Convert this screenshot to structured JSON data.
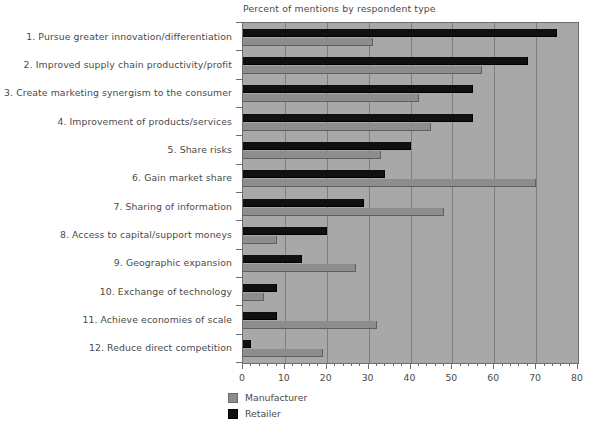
{
  "chart_data": {
    "type": "bar",
    "orientation": "horizontal",
    "title": "Percent of mentions by respondent type",
    "xlabel": "",
    "ylabel": "",
    "xlim": [
      0,
      80
    ],
    "xticks": [
      0,
      10,
      20,
      30,
      40,
      50,
      60,
      70,
      80
    ],
    "xtick_labels": [
      "0",
      "10",
      "20",
      "30",
      "40",
      "50",
      "60",
      "70",
      "80"
    ],
    "minor_tick_interval": 2,
    "grid": true,
    "grid_axis": "x",
    "legend_position": "bottom-left",
    "plot_background": "#a8a8a8",
    "categories": [
      "1. Pursue greater innovation/differentiation",
      "2. Improved supply chain productivity/profit",
      "3. Create marketing synergism to the consumer",
      "4. Improvement of products/services",
      "5. Share risks",
      "6. Gain market share",
      "7. Sharing of information",
      "8. Access to capital/support moneys",
      "9. Geographic expansion",
      "10. Exchange of technology",
      "11. Achieve economies of scale",
      "12. Reduce direct competition"
    ],
    "series": [
      {
        "name": "Retailer",
        "color": "#101010",
        "values": [
          75,
          68,
          55,
          55,
          40,
          34,
          29,
          20,
          14,
          8,
          8,
          2
        ]
      },
      {
        "name": "Manufacturer",
        "color": "#8d8d8d",
        "values": [
          31,
          57,
          42,
          45,
          33,
          70,
          48,
          8,
          27,
          5,
          32,
          19
        ]
      }
    ]
  },
  "legend": {
    "items": [
      {
        "label": "Manufacturer",
        "color": "#8d8d8d"
      },
      {
        "label": "Retailer",
        "color": "#101010"
      }
    ]
  }
}
